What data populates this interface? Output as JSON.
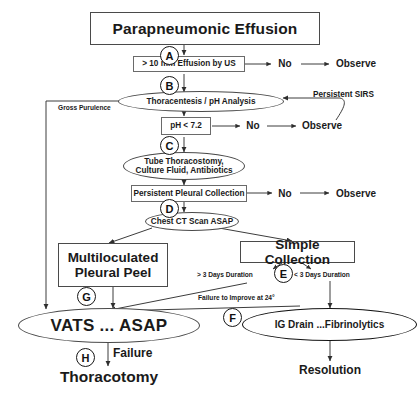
{
  "diagram": {
    "title": "Parapneumonic Effusion",
    "type": "clinical-management-flowchart"
  },
  "nodes": {
    "root": {
      "label": "Parapneumonic Effusion"
    },
    "effusion_us": {
      "label": "> 10 mm Effusion by US"
    },
    "thoracentesis": {
      "label": "Thoracentesis  /  pH Analysis"
    },
    "ph_test": {
      "label": "pH < 7.2"
    },
    "tube_thoracostomy_line1": {
      "label": "Tube Thoracostomy,"
    },
    "tube_thoracostomy_line2": {
      "label": "Culture Fluid, Antibiotics"
    },
    "persistent_collection": {
      "label": "Persistent Pleural Collection"
    },
    "chest_ct": {
      "label": "Chest CT Scan ASAP"
    },
    "multiloculated_line1": {
      "label": "Multiloculated"
    },
    "multiloculated_line2": {
      "label": "Pleural Peel"
    },
    "simple_collection": {
      "label": "Simple Collection"
    },
    "vats": {
      "label": "VATS ... ASAP"
    },
    "ig_drain": {
      "label": "IG Drain ...Fibrinolytics"
    },
    "thoracotomy": {
      "label": "Thoracotomy"
    },
    "resolution": {
      "label": "Resolution"
    },
    "observe_a": {
      "label": "Observe"
    },
    "observe_c": {
      "label": "Observe"
    },
    "observe_d": {
      "label": "Observe"
    },
    "no_a": {
      "label": "No"
    },
    "no_c": {
      "label": "No"
    },
    "no_d": {
      "label": "No"
    }
  },
  "markers": {
    "a": "A",
    "b": "B",
    "c": "C",
    "d": "D",
    "e": "E",
    "f": "F",
    "g": "G",
    "h": "H"
  },
  "edge_labels": {
    "gross_purulence": "Gross Purulence",
    "persistent_sirs": "Persistent  SIRS",
    "more_than_3_days": "> 3 Days Duration",
    "less_than_3_days": "< 3 Days Duration",
    "failure_to_improve": "Failure to Improve at 24°",
    "failure": "Failure"
  },
  "colors": {
    "stroke": "#3c3c3c",
    "text": "#1a1a1a",
    "background": "#ffffff"
  }
}
